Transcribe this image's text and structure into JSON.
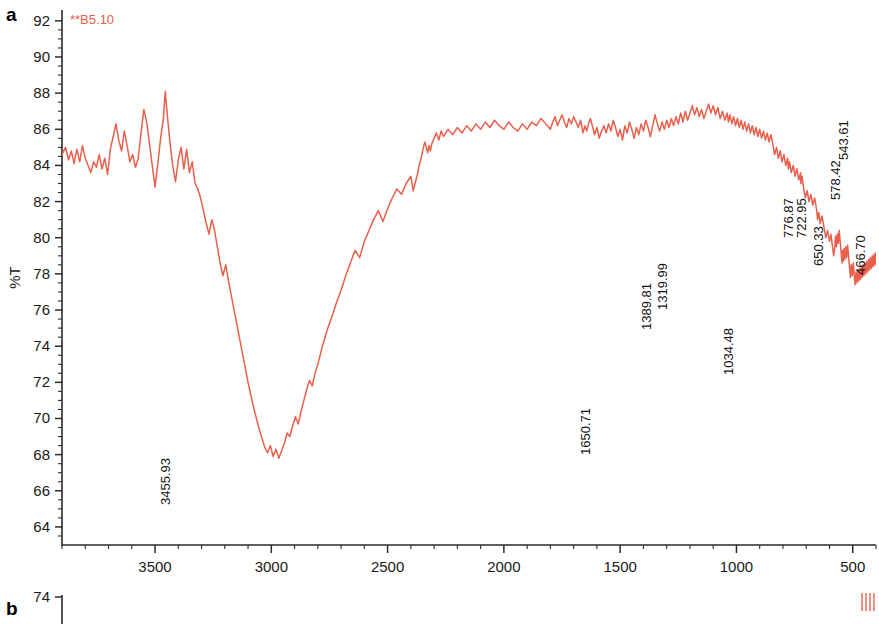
{
  "figure": {
    "panels": [
      {
        "letter": "a"
      },
      {
        "letter": "b"
      }
    ]
  },
  "chart_data": {
    "type": "line",
    "title": "",
    "sample_label": "**B5.10",
    "xlabel": "Wavenumbers (cm-1)",
    "xlabel_base": "Wavenumbers (cm",
    "xlabel_sup": "-1",
    "xlabel_tail": ")",
    "ylabel": "%T",
    "xlim": [
      3900,
      400
    ],
    "ylim": [
      63,
      92.6
    ],
    "x_ticks": [
      3500,
      3000,
      2500,
      2000,
      1500,
      1000,
      500
    ],
    "x_tick_labels": [
      "3500",
      "3000",
      "2500",
      "2000",
      "1500",
      "1000",
      "500"
    ],
    "x_minor_step": 100,
    "y_ticks": [
      92,
      90,
      88,
      86,
      84,
      82,
      80,
      78,
      76,
      74,
      72,
      70,
      68,
      66,
      64
    ],
    "y_tick_labels": [
      "92",
      "90",
      "88",
      "86",
      "84",
      "82",
      "80",
      "78",
      "76",
      "74",
      "72",
      "70",
      "68",
      "66",
      "64"
    ],
    "y_minor_step": 0.5,
    "grid": false,
    "legend": "none",
    "trace_color": "#e8604c",
    "annotations": [
      {
        "label": "3455.93",
        "wavenumber": 3455.93,
        "transmittance": 67.8,
        "label_y_px": 505
      },
      {
        "label": "1650.71",
        "wavenumber": 1650.71,
        "transmittance": 70.2,
        "label_y_px": 455
      },
      {
        "label": "1389.81",
        "wavenumber": 1389.81,
        "transmittance": 79.4,
        "label_y_px": 330
      },
      {
        "label": "1319.99",
        "wavenumber": 1319.99,
        "transmittance": 80.1,
        "label_y_px": 310
      },
      {
        "label": "1034.48",
        "wavenumber": 1034.48,
        "transmittance": 75.2,
        "label_y_px": 375
      },
      {
        "label": "776.87",
        "wavenumber": 776.87,
        "transmittance": 83.1,
        "label_y_px": 238
      },
      {
        "label": "722.95",
        "wavenumber": 722.95,
        "transmittance": 82.9,
        "label_y_px": 238
      },
      {
        "label": "650.33",
        "wavenumber": 650.33,
        "transmittance": 81.6,
        "label_y_px": 266
      },
      {
        "label": "578.42",
        "wavenumber": 578.42,
        "transmittance": 85.0,
        "label_y_px": 200
      },
      {
        "label": "543.61",
        "wavenumber": 543.61,
        "transmittance": 86.5,
        "label_y_px": 160
      },
      {
        "label": "466.70",
        "wavenumber": 466.7,
        "transmittance": 79.0,
        "label_y_px": 275
      }
    ],
    "series": [
      {
        "name": "B5.10",
        "points_x": [
          3900,
          3885,
          3872,
          3860,
          3848,
          3836,
          3824,
          3812,
          3800,
          3788,
          3776,
          3764,
          3752,
          3740,
          3728,
          3716,
          3704,
          3692,
          3680,
          3668,
          3656,
          3644,
          3632,
          3620,
          3608,
          3596,
          3584,
          3572,
          3560,
          3548,
          3536,
          3524,
          3512,
          3500,
          3488,
          3476,
          3464,
          3456,
          3448,
          3436,
          3424,
          3412,
          3400,
          3388,
          3376,
          3364,
          3352,
          3340,
          3328,
          3316,
          3304,
          3292,
          3280,
          3268,
          3256,
          3244,
          3232,
          3220,
          3208,
          3196,
          3184,
          3172,
          3160,
          3148,
          3136,
          3124,
          3112,
          3100,
          3088,
          3076,
          3064,
          3052,
          3040,
          3028,
          3016,
          3004,
          2992,
          2980,
          2968,
          2956,
          2944,
          2932,
          2920,
          2908,
          2896,
          2884,
          2872,
          2860,
          2848,
          2836,
          2824,
          2812,
          2800,
          2780,
          2760,
          2740,
          2720,
          2700,
          2680,
          2660,
          2640,
          2620,
          2600,
          2580,
          2560,
          2540,
          2520,
          2500,
          2480,
          2460,
          2440,
          2420,
          2400,
          2390,
          2380,
          2372,
          2364,
          2356,
          2348,
          2340,
          2334,
          2328,
          2322,
          2316,
          2310,
          2300,
          2290,
          2280,
          2270,
          2260,
          2240,
          2220,
          2200,
          2180,
          2160,
          2140,
          2120,
          2100,
          2080,
          2060,
          2040,
          2020,
          2000,
          1980,
          1960,
          1940,
          1920,
          1900,
          1880,
          1860,
          1840,
          1820,
          1800,
          1790,
          1780,
          1770,
          1760,
          1750,
          1740,
          1730,
          1720,
          1710,
          1700,
          1690,
          1680,
          1670,
          1660,
          1651,
          1644,
          1636,
          1628,
          1620,
          1610,
          1600,
          1590,
          1580,
          1570,
          1560,
          1550,
          1540,
          1530,
          1520,
          1510,
          1500,
          1490,
          1480,
          1470,
          1460,
          1450,
          1440,
          1430,
          1420,
          1410,
          1400,
          1390,
          1380,
          1370,
          1360,
          1350,
          1340,
          1330,
          1320,
          1310,
          1300,
          1290,
          1280,
          1270,
          1260,
          1250,
          1240,
          1230,
          1220,
          1210,
          1200,
          1190,
          1180,
          1170,
          1160,
          1150,
          1140,
          1130,
          1120,
          1110,
          1100,
          1090,
          1080,
          1070,
          1060,
          1050,
          1040,
          1034,
          1028,
          1020,
          1012,
          1004,
          996,
          988,
          980,
          972,
          964,
          956,
          948,
          940,
          932,
          924,
          916,
          908,
          900,
          892,
          884,
          876,
          868,
          860,
          852,
          844,
          836,
          828,
          820,
          812,
          804,
          796,
          788,
          780,
          777,
          772,
          764,
          756,
          748,
          740,
          732,
          724,
          723,
          718,
          712,
          704,
          696,
          688,
          680,
          672,
          664,
          656,
          651,
          646,
          640,
          632,
          624,
          616,
          608,
          600,
          594,
          588,
          582,
          578,
          574,
          570,
          566,
          562,
          558,
          554,
          550,
          546,
          544,
          541,
          538,
          534,
          530,
          526,
          522,
          518,
          514,
          510,
          506,
          502,
          498,
          494,
          490,
          486,
          482,
          478,
          474,
          470,
          467,
          464,
          460,
          456,
          452,
          448,
          444,
          440,
          436,
          432,
          428,
          424,
          420,
          416,
          412,
          408,
          404,
          400
        ],
        "points_y": [
          84.6,
          85.0,
          84.3,
          84.8,
          84.1,
          84.9,
          84.2,
          85.1,
          84.4,
          84.0,
          83.6,
          84.2,
          83.9,
          84.6,
          83.8,
          84.4,
          83.5,
          84.9,
          85.6,
          86.3,
          85.4,
          84.8,
          85.9,
          85.1,
          84.2,
          84.6,
          83.9,
          84.4,
          85.8,
          87.1,
          86.4,
          85.2,
          84.0,
          82.8,
          84.1,
          85.5,
          86.6,
          88.1,
          86.9,
          85.3,
          84.0,
          83.1,
          84.3,
          85.0,
          83.8,
          84.9,
          83.6,
          84.2,
          83.0,
          82.7,
          82.2,
          81.5,
          80.8,
          80.2,
          81.0,
          80.4,
          79.5,
          78.6,
          77.9,
          78.5,
          77.6,
          76.8,
          76.0,
          75.2,
          74.4,
          73.6,
          72.8,
          72.0,
          71.3,
          70.6,
          70.0,
          69.4,
          68.9,
          68.4,
          68.1,
          68.5,
          67.9,
          68.3,
          67.8,
          68.2,
          68.6,
          69.2,
          69.0,
          69.6,
          70.1,
          69.7,
          70.4,
          71.0,
          71.6,
          72.1,
          71.8,
          72.5,
          73.0,
          74.0,
          74.9,
          75.6,
          76.4,
          77.1,
          77.9,
          78.6,
          79.3,
          78.9,
          79.8,
          80.4,
          81.0,
          81.5,
          80.9,
          81.6,
          82.2,
          82.7,
          82.4,
          83.0,
          83.4,
          82.6,
          83.1,
          83.5,
          84.0,
          84.4,
          84.9,
          85.3,
          85.0,
          84.7,
          85.1,
          84.8,
          85.2,
          85.5,
          85.8,
          85.4,
          85.9,
          85.6,
          86.0,
          85.7,
          86.1,
          85.8,
          86.2,
          85.9,
          86.3,
          86.0,
          86.4,
          86.1,
          86.5,
          86.2,
          86.0,
          86.4,
          86.1,
          85.9,
          86.3,
          86.0,
          86.4,
          86.2,
          86.6,
          86.3,
          86.0,
          86.4,
          86.7,
          86.2,
          86.5,
          86.8,
          86.4,
          86.1,
          86.6,
          86.3,
          86.7,
          86.4,
          86.1,
          86.5,
          85.8,
          86.2,
          85.9,
          86.3,
          86.6,
          86.2,
          85.7,
          86.1,
          85.5,
          85.9,
          86.2,
          85.8,
          86.3,
          85.9,
          86.5,
          86.1,
          85.6,
          86.0,
          85.4,
          86.2,
          85.8,
          86.4,
          86.0,
          85.5,
          86.1,
          85.7,
          86.3,
          85.9,
          86.5,
          86.1,
          85.6,
          86.2,
          86.8,
          86.3,
          85.9,
          86.4,
          86.0,
          86.5,
          86.1,
          86.6,
          86.2,
          86.7,
          86.3,
          86.9,
          86.4,
          87.0,
          86.5,
          86.9,
          87.3,
          86.8,
          87.2,
          86.7,
          87.1,
          86.6,
          87.0,
          87.4,
          86.9,
          87.3,
          86.8,
          87.2,
          86.6,
          87.0,
          86.5,
          86.9,
          86.4,
          86.8,
          86.3,
          86.7,
          86.2,
          86.6,
          86.1,
          86.5,
          86.0,
          86.4,
          85.9,
          86.3,
          85.8,
          86.2,
          85.7,
          86.1,
          85.6,
          86.0,
          85.5,
          85.9,
          85.4,
          85.8,
          85.3,
          85.7,
          85.2,
          84.6,
          85.0,
          84.4,
          84.8,
          84.2,
          84.6,
          84.0,
          84.4,
          83.8,
          84.2,
          83.6,
          84.0,
          83.4,
          83.8,
          83.2,
          83.6,
          83.0,
          83.4,
          82.8,
          82.2,
          82.6,
          82.0,
          82.4,
          81.8,
          82.2,
          81.6,
          81.0,
          81.4,
          80.8,
          81.2,
          80.6,
          80.0,
          80.4,
          79.8,
          80.2,
          79.6,
          79.0,
          79.4,
          80.1,
          79.5,
          80.2,
          79.7,
          80.4,
          79.8,
          79.2,
          78.6,
          79.3,
          78.7,
          79.4,
          78.8,
          79.5,
          78.9,
          79.6,
          79.0,
          78.4,
          77.8,
          78.5,
          77.9,
          78.6,
          78.0,
          77.4,
          78.1,
          77.5,
          78.2,
          77.6,
          78.3,
          77.7,
          78.4,
          77.8,
          78.5,
          77.9,
          78.6,
          78.0,
          78.7,
          78.1,
          78.8,
          78.2,
          78.9,
          78.3,
          79.0,
          78.4,
          79.1,
          78.5,
          79.2,
          78.6,
          79.3,
          78.7,
          79.4,
          78.8,
          78.2,
          77.6,
          77.0,
          76.4,
          75.8,
          75.2,
          75.8,
          76.5,
          77.2,
          77.9,
          78.6,
          79.3,
          80.0,
          80.6,
          81.1,
          80.7,
          81.3,
          80.9,
          81.5,
          81.1,
          81.7,
          81.3,
          81.9,
          81.5,
          82.1,
          81.7,
          82.3,
          81.9,
          82.5,
          82.1,
          82.7,
          82.3,
          82.9,
          83.5,
          84.1,
          83.5,
          84.2,
          83.1,
          83.8,
          84.5,
          83.9,
          84.6,
          84.0,
          84.7,
          84.1,
          83.5,
          82.9,
          83.6,
          84.3,
          83.7,
          84.4,
          83.8,
          84.5,
          83.9,
          83.3,
          82.7,
          82.1,
          81.6,
          82.3,
          83.0,
          83.7,
          84.4,
          85.1,
          85.8,
          86.5,
          87.2,
          86.0,
          85.0,
          86.2,
          85.3,
          86.0,
          85.2,
          86.4,
          87.6,
          88.8,
          90.0,
          91.5,
          92.4,
          90.0,
          87.0,
          86.6,
          86.0,
          86.5,
          87.2,
          88.0,
          89.5,
          91.0,
          92.4,
          90.5,
          88.0,
          86.8,
          86.2,
          85.8,
          86.4,
          87.5,
          89.0,
          91.0,
          92.4,
          90.0,
          87.5,
          85.5,
          84.0,
          82.5,
          81.0,
          79.8,
          79.2,
          80.0,
          81.5,
          83.0,
          85.0,
          87.0,
          89.0,
          91.0,
          92.4,
          92.4,
          92.4,
          92.4,
          92.4,
          92.4
        ]
      }
    ]
  },
  "panel_b": {
    "y_tick_label": "74",
    "trace_color": "#e8604c"
  }
}
